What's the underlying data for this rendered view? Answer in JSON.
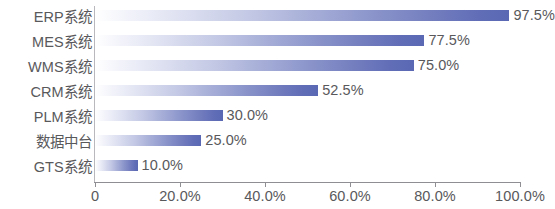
{
  "chart_data": {
    "type": "bar",
    "orientation": "horizontal",
    "title": "",
    "subtitle": "",
    "xlabel": "",
    "ylabel": "",
    "categories": [
      "ERP系统",
      "MES系统",
      "WMS系统",
      "CRM系统",
      "PLM系统",
      "数据中台",
      "GTS系统"
    ],
    "values": [
      97.5,
      77.5,
      75.0,
      52.5,
      30.0,
      25.0,
      10.0
    ],
    "value_labels": [
      "97.5%",
      "77.5%",
      "75.0%",
      "52.5%",
      "30.0%",
      "25.0%",
      "10.0%"
    ],
    "xlim": [
      0,
      100
    ],
    "x_tick_values": [
      0,
      20,
      40,
      60,
      80,
      100
    ],
    "x_tick_labels": [
      "0",
      "20.0%",
      "40.0%",
      "60.0%",
      "80.0%",
      "100.0%"
    ],
    "grid": false,
    "legend": false,
    "legend_position": "none",
    "bar_gradient_start": "#ffffff",
    "bar_gradient_end": "#5a67b3",
    "text_color": "#59595c",
    "axis_color": "#8f8f93",
    "background": "#ffffff"
  }
}
